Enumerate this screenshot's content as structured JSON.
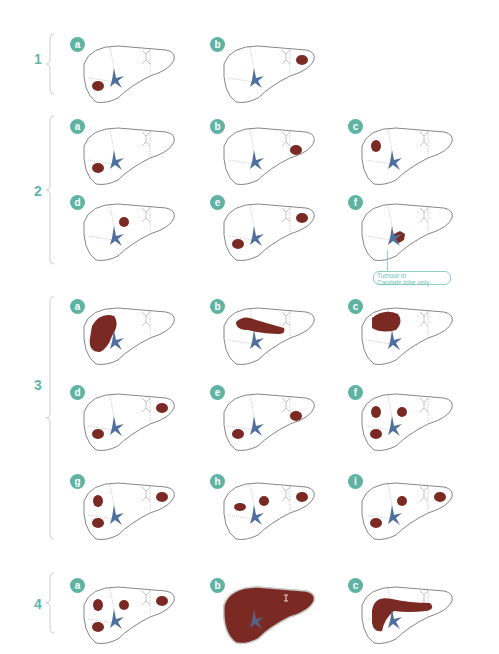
{
  "figure": {
    "accent_color": "#5fb3a3",
    "tumour_color": "#7a2a22",
    "vessel_color": "#4f6f9f",
    "outline_color": "#666666"
  },
  "groups": [
    {
      "label": "1",
      "panels": [
        {
          "letter": "a",
          "tumours": [
            "right-inferior-small"
          ]
        },
        {
          "letter": "b",
          "tumours": [
            "left-lateral-small"
          ]
        }
      ]
    },
    {
      "label": "2",
      "panels": [
        {
          "letter": "a",
          "tumours": [
            "right-inferior-small"
          ]
        },
        {
          "letter": "b",
          "tumours": [
            "left-medial-small"
          ]
        },
        {
          "letter": "c",
          "tumours": [
            "right-superior-small"
          ]
        },
        {
          "letter": "d",
          "tumours": [
            "central-small"
          ]
        },
        {
          "letter": "e",
          "tumours": [
            "right-inferior-small",
            "left-lateral-small"
          ]
        },
        {
          "letter": "f",
          "tumours": [
            "caudate"
          ]
        }
      ]
    },
    {
      "label": "3",
      "panels": [
        {
          "letter": "a",
          "tumours": [
            "right-lobe-large"
          ]
        },
        {
          "letter": "b",
          "tumours": [
            "central-elongated"
          ]
        },
        {
          "letter": "c",
          "tumours": [
            "right-superior-large"
          ]
        },
        {
          "letter": "d",
          "tumours": [
            "right-inferior-small",
            "left-lateral-small"
          ]
        },
        {
          "letter": "e",
          "tumours": [
            "right-inferior-small",
            "left-medial-small"
          ]
        },
        {
          "letter": "f",
          "tumours": [
            "right-superior-small",
            "central-small",
            "right-inferior-small"
          ]
        },
        {
          "letter": "g",
          "tumours": [
            "right-superior-small",
            "right-inferior-small",
            "left-lateral-small"
          ]
        },
        {
          "letter": "h",
          "tumours": [
            "right-middle-small",
            "central-small",
            "left-lateral-small"
          ]
        },
        {
          "letter": "i",
          "tumours": [
            "central-small",
            "left-lateral-small",
            "right-inferior-small"
          ]
        }
      ]
    },
    {
      "label": "4",
      "panels": [
        {
          "letter": "a",
          "tumours": [
            "right-superior-small",
            "central-small",
            "left-lateral-small",
            "right-inferior-small"
          ]
        },
        {
          "letter": "b",
          "tumours": [
            "whole-liver"
          ]
        },
        {
          "letter": "c",
          "tumours": [
            "band-large"
          ]
        }
      ]
    }
  ],
  "callout": {
    "text_line1": "Tumour in",
    "text_line2": "Caudate lobe only"
  }
}
